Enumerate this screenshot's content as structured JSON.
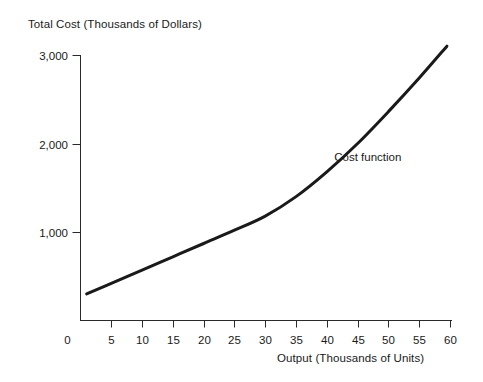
{
  "chart_data": {
    "type": "line",
    "title": "",
    "xlabel": "Output (Thousands of Units)",
    "ylabel": "Total Cost (Thousands of Dollars)",
    "xlim": [
      0,
      60
    ],
    "ylim": [
      0,
      3000
    ],
    "xticks": [
      0,
      5,
      10,
      15,
      20,
      25,
      30,
      35,
      40,
      45,
      50,
      55,
      60
    ],
    "xticklabels": [
      "0",
      "5",
      "10",
      "15",
      "20",
      "25",
      "30",
      "35",
      "40",
      "45",
      "50",
      "55",
      "60"
    ],
    "yticks": [
      1000,
      2000,
      3000
    ],
    "yticklabels": [
      "1,000",
      "2,000",
      "3,000"
    ],
    "grid": false,
    "legend_position": "inline-annotation",
    "series": [
      {
        "name": "Cost function",
        "color": "#1a1a1a",
        "linewidth": 3,
        "x": [
          1,
          5,
          10,
          15,
          20,
          25,
          30,
          35,
          40,
          45,
          50,
          55,
          59.5
        ],
        "values": [
          300,
          420,
          570,
          720,
          870,
          1020,
          1180,
          1400,
          1680,
          2000,
          2360,
          2740,
          3100
        ]
      }
    ],
    "annotations": [
      {
        "text": "Cost function",
        "x": 49,
        "y": 1840
      }
    ]
  },
  "axes": {
    "y_title": "Total Cost (Thousands of Dollars)",
    "x_title": "Output (Thousands of Units)"
  }
}
